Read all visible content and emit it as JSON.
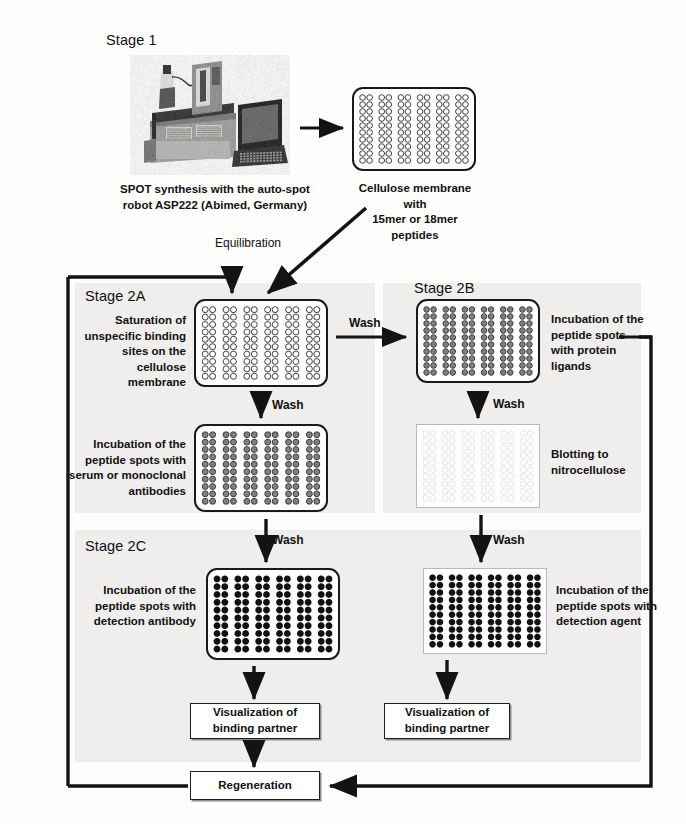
{
  "figure": {
    "colors": {
      "ink": "#111111",
      "membrane_border": "#1a1a1a",
      "nitro_border": "#b9b9b9",
      "panel": "#efeeec",
      "spot_empty": "#ffffff",
      "spot_gray": "#808080",
      "spot_black": "#111111",
      "spot_faint": "#e2e2e2"
    }
  },
  "stages": {
    "stage1": {
      "label": "Stage 1"
    },
    "stage2a": {
      "label": "Stage 2A"
    },
    "stage2b": {
      "label": "Stage 2B"
    },
    "stage2c": {
      "label": "Stage 2C"
    }
  },
  "captions": {
    "robot": "SPOT synthesis with the auto-spot\nrobot ASP222 (Abimed, Germany)",
    "membrane_peptides": "Cellulose membrane with\n15mer or 18mer peptides",
    "saturation": "Saturation of\nunspecific binding\nsites on the cellulose\nmembrane",
    "incubation_serum": "Incubation of the\npeptide spots with\nserum or monoclonal\nantibodies",
    "incubation_ligands": "Incubation of the\npeptide spots\nwith protein\nligands",
    "blotting": "Blotting to\nnitrocellulose",
    "detection_antibody": "Incubation of the\npeptide spots with\ndetection antibody",
    "detection_agent": "Incubation of the\npeptide spots with\ndetection agent"
  },
  "arrow_labels": {
    "equilibration": "Equilibration",
    "wash_a_to_b": "Wash",
    "wash_a_down": "Wash",
    "wash_b_down": "Wash",
    "wash_a_to_c": "Wash",
    "wash_b_to_c": "Wash"
  },
  "boxes": {
    "visualization_left": "Visualization of\nbinding partner",
    "visualization_right": "Visualization of\nbinding partner",
    "regeneration": "Regeneration"
  },
  "membranes": [
    {
      "id": "m-stage1",
      "name": "cellulose-membrane-stage1",
      "shape": "rounded",
      "spot": "empty",
      "x": 352,
      "y": 87,
      "w": 124,
      "h": 84
    },
    {
      "id": "m-2a-top",
      "name": "membrane-saturation",
      "shape": "rounded",
      "spot": "empty",
      "x": 194,
      "y": 299,
      "w": 134,
      "h": 88
    },
    {
      "id": "m-2a-bottom",
      "name": "membrane-serum-incubation",
      "shape": "rounded",
      "spot": "gray",
      "x": 194,
      "y": 424,
      "w": 134,
      "h": 88
    },
    {
      "id": "m-2b-top",
      "name": "membrane-protein-ligands",
      "shape": "rounded",
      "spot": "gray",
      "x": 416,
      "y": 299,
      "w": 124,
      "h": 84
    },
    {
      "id": "m-2b-bottom",
      "name": "membrane-nitrocellulose-blot",
      "shape": "square",
      "spot": "faint",
      "x": 416,
      "y": 424,
      "w": 124,
      "h": 84
    },
    {
      "id": "m-2c-left",
      "name": "membrane-detection-antibody",
      "shape": "rounded",
      "spot": "black",
      "x": 206,
      "y": 568,
      "w": 134,
      "h": 92
    },
    {
      "id": "m-2c-right",
      "name": "membrane-detection-agent",
      "shape": "square",
      "spot": "black",
      "x": 423,
      "y": 568,
      "w": 124,
      "h": 86
    }
  ],
  "grid": {
    "column_pairs": 6,
    "columns": 12,
    "rows": 10
  }
}
